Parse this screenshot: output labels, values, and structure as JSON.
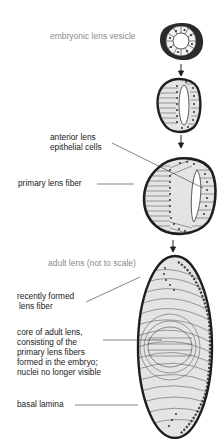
{
  "diagram": {
    "stages": [
      {
        "id": "vesicle",
        "label": "embryonic lens vesicle"
      },
      {
        "id": "elongating",
        "label": ""
      },
      {
        "id": "embryonic_lens",
        "label": ""
      },
      {
        "id": "adult_lens",
        "label": "adult lens (not to scale)"
      }
    ],
    "labels": {
      "embryonic_lens_vesicle": "embryonic lens vesicle",
      "anterior_epithelial_line1": "anterior lens",
      "anterior_epithelial_line2": "epithelial cells",
      "primary_lens_fiber": "primary lens fiber",
      "adult_lens": "adult lens (not to scale)",
      "recently_formed_line1": "recently formed",
      "recently_formed_line2": "lens fiber",
      "core_line1": "core of adult lens,",
      "core_line2": "consisting of the",
      "core_line3": "primary lens fibers",
      "core_line4": "formed in the embryo;",
      "core_line5": "nuclei no longer visible",
      "basal_lamina": "basal lamina"
    },
    "colors": {
      "outline": "#1e1e1e",
      "fill": "#e2e2e2",
      "title_gray": "#8a8a8a",
      "text": "#1a1a1a"
    }
  }
}
